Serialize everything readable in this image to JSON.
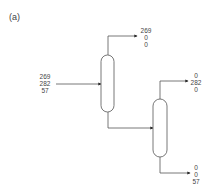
{
  "panel_label": "(a)",
  "feed": {
    "values": [
      "269",
      "282",
      "57"
    ]
  },
  "column1": {
    "name": "column-1",
    "top_product": {
      "values": [
        "269",
        "0",
        "0"
      ]
    }
  },
  "column2": {
    "name": "column-2",
    "top_product": {
      "values": [
        "0",
        "282",
        "0"
      ]
    },
    "bottom_product": {
      "values": [
        "0",
        "0",
        "57"
      ]
    }
  },
  "colors": {
    "line": "#555555",
    "vessel_fill": "#ffffff"
  }
}
